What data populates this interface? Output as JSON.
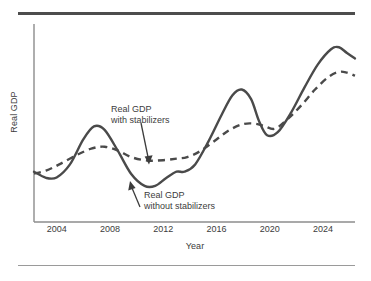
{
  "figure": {
    "kind": "economics-textbook-line-graph",
    "background": "#ffffff",
    "rules": {
      "top_color": "#4d4d4d",
      "bottom_color": "#9a9a9a"
    }
  },
  "chart_data": {
    "type": "line",
    "title": "",
    "xlabel": "Year",
    "ylabel": "Real GDP",
    "grid": false,
    "legend_position": "inline-annotations",
    "xlim": [
      2002.3,
      2026.4
    ],
    "ylim": [
      0,
      1
    ],
    "xticks": [
      2004,
      2008,
      2012,
      2016,
      2020,
      2024
    ],
    "xtick_labels": [
      "2004",
      "2008",
      "2012",
      "2016",
      "2020",
      "2024"
    ],
    "yticks": [],
    "ytick_labels": [],
    "axis_color": "#8c8c8c",
    "series": [
      {
        "name": "Real GDP without stabilizers",
        "style": "solid",
        "color": "#4a4a4a",
        "width": 2.4,
        "x": [
          2002.3,
          2003.2,
          2004.0,
          2005.0,
          2006.0,
          2006.8,
          2007.6,
          2008.6,
          2009.6,
          2010.6,
          2011.4,
          2012.2,
          2013.0,
          2013.6,
          2014.4,
          2015.4,
          2016.4,
          2017.2,
          2017.9,
          2018.6,
          2019.2,
          2019.8,
          2020.6,
          2021.6,
          2022.6,
          2023.6,
          2024.6,
          2025.2,
          2025.8,
          2026.4
        ],
        "y": [
          0.262,
          0.23,
          0.232,
          0.3,
          0.43,
          0.498,
          0.48,
          0.37,
          0.25,
          0.188,
          0.188,
          0.228,
          0.262,
          0.262,
          0.3,
          0.42,
          0.56,
          0.66,
          0.69,
          0.64,
          0.525,
          0.452,
          0.468,
          0.57,
          0.7,
          0.82,
          0.9,
          0.91,
          0.88,
          0.852
        ]
      },
      {
        "name": "Real GDP with stabilizers",
        "style": "dashed",
        "color": "#4a4a4a",
        "width": 2.4,
        "dash": "7,5",
        "x": [
          2002.3,
          2003.2,
          2004.2,
          2005.4,
          2006.6,
          2007.6,
          2008.6,
          2009.6,
          2010.8,
          2012.0,
          2013.0,
          2013.8,
          2014.8,
          2016.0,
          2017.0,
          2018.0,
          2018.9,
          2019.6,
          2020.4,
          2021.4,
          2022.4,
          2023.4,
          2024.4,
          2025.2,
          2025.8,
          2026.4
        ],
        "y": [
          0.252,
          0.268,
          0.3,
          0.345,
          0.382,
          0.392,
          0.372,
          0.338,
          0.32,
          0.322,
          0.33,
          0.338,
          0.37,
          0.43,
          0.48,
          0.51,
          0.512,
          0.5,
          0.486,
          0.54,
          0.61,
          0.69,
          0.755,
          0.782,
          0.778,
          0.762
        ]
      }
    ],
    "annotations": [
      {
        "id": "annot-with",
        "lines": [
          "Real GDP",
          "with stabilizers"
        ],
        "text": "Real GDP with stabilizers",
        "target_series": "Real GDP with stabilizers",
        "arrow_from": [
          141,
          123
        ],
        "arrow_to": [
          149,
          162
        ]
      },
      {
        "id": "annot-without",
        "lines": [
          "Real GDP",
          "without stabilizers"
        ],
        "text": "Real GDP without stabilizers",
        "target_series": "Real GDP without stabilizers",
        "arrow_from": [
          140,
          207
        ],
        "arrow_to": [
          130,
          183
        ]
      }
    ]
  }
}
